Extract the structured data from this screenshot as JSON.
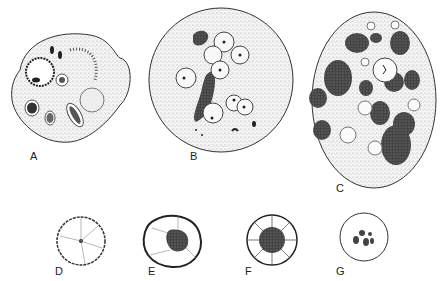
{
  "figure": {
    "panels": [
      {
        "id": "A",
        "label": "A",
        "description": "irregular cell with nucleus and inclusions"
      },
      {
        "id": "B",
        "label": "B",
        "description": "round cell with several ingested cells"
      },
      {
        "id": "C",
        "label": "C",
        "description": "large oval cell with dark inclusions and vacuoles"
      },
      {
        "id": "D",
        "label": "D",
        "description": "small round cell with central dot and radial lines"
      },
      {
        "id": "E",
        "label": "E",
        "description": "round cell with stippled central mass"
      },
      {
        "id": "F",
        "label": "F",
        "description": "round cell with dark center and peripheral segments"
      },
      {
        "id": "G",
        "label": "G",
        "description": "round cell with cluster of small granules"
      }
    ]
  },
  "colors": {
    "ink": "#222222",
    "stipple": "#d9d9d9",
    "dark": "#3a3a3a"
  }
}
